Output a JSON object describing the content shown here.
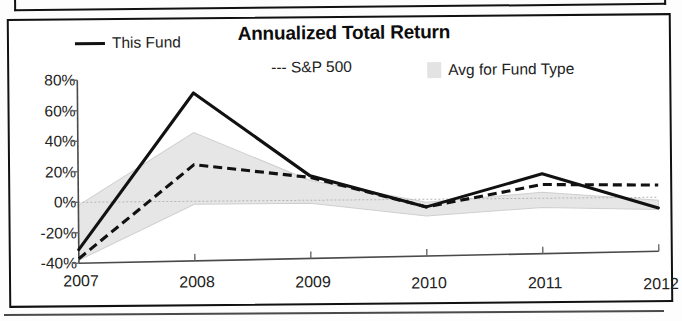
{
  "chart_data": {
    "type": "line",
    "title": "Annualized Total Return",
    "xlabel": "",
    "ylabel": "",
    "x": [
      "2007",
      "2008",
      "2009",
      "2010",
      "2011",
      "2012"
    ],
    "x_axis_suffix": "YTD",
    "categories": [
      "2007",
      "2008",
      "2009",
      "2010",
      "2011",
      "2012"
    ],
    "ylim": [
      -40,
      80
    ],
    "ytick_values": [
      80,
      60,
      40,
      20,
      0,
      -20,
      -40
    ],
    "ytick_labels": [
      "80%",
      "60%",
      "40%",
      "20%",
      "0%",
      "-20%",
      "-40%"
    ],
    "grid": false,
    "legend_position": "top",
    "series": [
      {
        "name": "This Fund",
        "style": "solid",
        "color": "#111111",
        "values": [
          -31,
          71,
          16,
          -5,
          16,
          -7
        ]
      },
      {
        "name": "S&P 500",
        "style": "dashed",
        "color": "#111111",
        "values": [
          -37,
          24,
          15,
          -5,
          9,
          8
        ]
      },
      {
        "name": "Avg for Fund Type",
        "style": "band",
        "color": "#e6e6e6",
        "band_upper": [
          -2,
          45,
          13,
          -2,
          4,
          -2
        ],
        "band_lower": [
          -38,
          -2,
          -2,
          -11,
          -6,
          -8
        ]
      }
    ]
  },
  "legend": {
    "items": [
      {
        "label": "This Fund",
        "marker": "solid-line-swatch"
      },
      {
        "label": "--- S&P 500",
        "marker": "dashed-line-swatch"
      },
      {
        "label": "Avg for Fund Type",
        "marker": "gray-band-swatch"
      }
    ]
  }
}
